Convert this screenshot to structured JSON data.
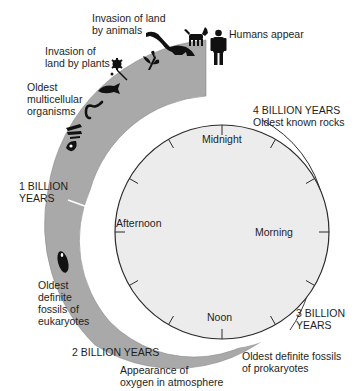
{
  "clock": {
    "midnight": "Midnight",
    "morning": "Morning",
    "noon": "Noon",
    "afternoon": "Afternoon"
  },
  "milestones": {
    "four_billion": "4 BILLION YEARS",
    "oldest_rocks": "Oldest known rocks",
    "three_billion_1": "3 BILLION",
    "three_billion_2": "YEARS",
    "prokaryotes_1": "Oldest definite fossils",
    "prokaryotes_2": "of prokaryotes",
    "two_billion": "2 BILLION YEARS",
    "oxygen_1": "Appearance of",
    "oxygen_2": "oxygen in atmosphere",
    "eukaryotes_1": "Oldest",
    "eukaryotes_2": "definite",
    "eukaryotes_3": "fossils of",
    "eukaryotes_4": "eukaryotes",
    "one_billion_1": "1 BILLION",
    "one_billion_2": "YEARS",
    "multicellular_1": "Oldest",
    "multicellular_2": "multicellular",
    "multicellular_3": "organisms",
    "plants_1": "Invasion of",
    "plants_2": "land by plants",
    "animals_1": "Invasion of land",
    "animals_2": "by animals",
    "humans": "Humans appear"
  },
  "colors": {
    "band": "#a9a9a9",
    "clock_face": "#ececec",
    "outline": "#2a2a2a",
    "silhouette": "#111111"
  }
}
